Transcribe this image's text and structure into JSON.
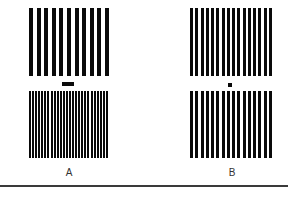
{
  "panels": [
    {
      "label": "A",
      "top_grating": {
        "bars": 11,
        "bar_width": 4
      },
      "bottom_grating": {
        "bars": 26,
        "bar_width": 2
      },
      "marker": "dash"
    },
    {
      "label": "B",
      "top_grating": {
        "bars": 16,
        "bar_width": 3
      },
      "bottom_grating": {
        "bars": 16,
        "bar_width": 3
      },
      "marker": "dot"
    }
  ],
  "colors": {
    "bar": "#0a0a0a",
    "background": "#ffffff",
    "rule": "#3a3a3a"
  }
}
